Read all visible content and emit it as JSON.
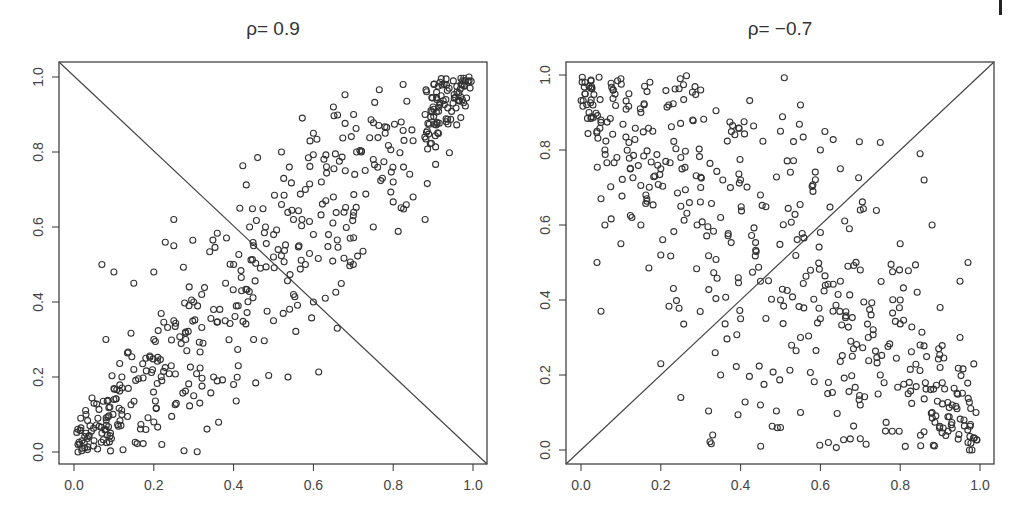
{
  "chart_data": [
    {
      "type": "scatter",
      "title": "ρ= 0.9",
      "xlabel": "",
      "ylabel": "",
      "xlim": [
        0,
        1
      ],
      "ylim": [
        0,
        1
      ],
      "x_ticks": [
        "0.0",
        "0.2",
        "0.4",
        "0.6",
        "0.8",
        "1.0"
      ],
      "y_ticks": [
        "0.0",
        "0.2",
        "0.4",
        "0.6",
        "0.8",
        "1.0"
      ],
      "grid": false,
      "legend": null,
      "reference_line": {
        "from": [
          0,
          1
        ],
        "to": [
          1,
          0
        ],
        "description": "anti-diagonal line from top-left to bottom-right corner"
      },
      "marker": "open circle",
      "correlation": 0.9,
      "n_points_approx": 500,
      "sample_points": [
        [
          0.01,
          0.0
        ],
        [
          0.02,
          0.03
        ],
        [
          0.01,
          0.02
        ],
        [
          0.03,
          0.05
        ],
        [
          0.02,
          0.01
        ],
        [
          0.04,
          0.07
        ],
        [
          0.05,
          0.03
        ],
        [
          0.06,
          0.09
        ],
        [
          0.03,
          0.1
        ],
        [
          0.07,
          0.05
        ],
        [
          0.08,
          0.06
        ],
        [
          0.09,
          0.12
        ],
        [
          0.1,
          0.14
        ],
        [
          0.05,
          0.13
        ],
        [
          0.12,
          0.1
        ],
        [
          0.08,
          0.3
        ],
        [
          0.07,
          0.5
        ],
        [
          0.1,
          0.48
        ],
        [
          0.12,
          0.2
        ],
        [
          0.15,
          0.22
        ],
        [
          0.18,
          0.25
        ],
        [
          0.2,
          0.3
        ],
        [
          0.22,
          0.19
        ],
        [
          0.25,
          0.35
        ],
        [
          0.28,
          0.3
        ],
        [
          0.2,
          0.48
        ],
        [
          0.25,
          0.55
        ],
        [
          0.3,
          0.4
        ],
        [
          0.32,
          0.42
        ],
        [
          0.35,
          0.38
        ],
        [
          0.38,
          0.45
        ],
        [
          0.4,
          0.5
        ],
        [
          0.42,
          0.43
        ],
        [
          0.45,
          0.55
        ],
        [
          0.48,
          0.6
        ],
        [
          0.5,
          0.52
        ],
        [
          0.44,
          0.6
        ],
        [
          0.52,
          0.66
        ],
        [
          0.55,
          0.62
        ],
        [
          0.58,
          0.7
        ],
        [
          0.6,
          0.58
        ],
        [
          0.62,
          0.72
        ],
        [
          0.65,
          0.68
        ],
        [
          0.68,
          0.75
        ],
        [
          0.7,
          0.63
        ],
        [
          0.72,
          0.8
        ],
        [
          0.75,
          0.78
        ],
        [
          0.78,
          0.85
        ],
        [
          0.8,
          0.72
        ],
        [
          0.82,
          0.88
        ],
        [
          0.85,
          0.83
        ],
        [
          0.88,
          0.9
        ],
        [
          0.9,
          0.92
        ],
        [
          0.92,
          0.95
        ],
        [
          0.94,
          0.97
        ],
        [
          0.96,
          0.96
        ],
        [
          0.98,
          0.99
        ],
        [
          0.95,
          0.93
        ],
        [
          0.97,
          0.98
        ],
        [
          0.99,
          1.0
        ],
        [
          0.3,
          0.15
        ],
        [
          0.35,
          0.2
        ],
        [
          0.4,
          0.18
        ],
        [
          0.45,
          0.3
        ],
        [
          0.5,
          0.35
        ],
        [
          0.55,
          0.42
        ],
        [
          0.6,
          0.4
        ],
        [
          0.66,
          0.33
        ],
        [
          0.7,
          0.5
        ],
        [
          0.25,
          0.62
        ],
        [
          0.15,
          0.45
        ],
        [
          0.52,
          0.8
        ],
        [
          0.6,
          0.85
        ],
        [
          0.65,
          0.92
        ],
        [
          0.88,
          0.62
        ],
        [
          0.85,
          0.68
        ],
        [
          0.75,
          0.6
        ],
        [
          0.58,
          0.5
        ],
        [
          0.2,
          0.08
        ],
        [
          0.22,
          0.02
        ]
      ]
    },
    {
      "type": "scatter",
      "title": "ρ= −0.7",
      "xlabel": "",
      "ylabel": "",
      "xlim": [
        0,
        1
      ],
      "ylim": [
        0,
        1
      ],
      "x_ticks": [
        "0.0",
        "0.2",
        "0.4",
        "0.6",
        "0.8",
        "1.0"
      ],
      "y_ticks": [
        "0.0",
        "0.2",
        "0.4",
        "0.6",
        "0.8",
        "1.0"
      ],
      "grid": false,
      "legend": null,
      "reference_line": {
        "from": [
          0,
          0
        ],
        "to": [
          1,
          1
        ],
        "description": "diagonal line from bottom-left to top-right corner"
      },
      "marker": "open circle",
      "correlation": -0.7,
      "n_points_approx": 500,
      "sample_points": [
        [
          0.01,
          0.98
        ],
        [
          0.02,
          0.97
        ],
        [
          0.01,
          0.95
        ],
        [
          0.03,
          0.92
        ],
        [
          0.02,
          0.9
        ],
        [
          0.05,
          0.88
        ],
        [
          0.08,
          0.96
        ],
        [
          0.1,
          0.99
        ],
        [
          0.12,
          0.95
        ],
        [
          0.15,
          0.9
        ],
        [
          0.04,
          0.85
        ],
        [
          0.06,
          0.8
        ],
        [
          0.09,
          0.78
        ],
        [
          0.12,
          0.82
        ],
        [
          0.18,
          0.85
        ],
        [
          0.2,
          0.75
        ],
        [
          0.22,
          0.92
        ],
        [
          0.25,
          0.78
        ],
        [
          0.28,
          0.88
        ],
        [
          0.3,
          0.96
        ],
        [
          0.05,
          0.67
        ],
        [
          0.06,
          0.6
        ],
        [
          0.04,
          0.5
        ],
        [
          0.05,
          0.37
        ],
        [
          0.1,
          0.55
        ],
        [
          0.15,
          0.6
        ],
        [
          0.2,
          0.52
        ],
        [
          0.25,
          0.65
        ],
        [
          0.3,
          0.7
        ],
        [
          0.35,
          0.62
        ],
        [
          0.4,
          0.72
        ],
        [
          0.45,
          0.68
        ],
        [
          0.5,
          0.85
        ],
        [
          0.55,
          0.92
        ],
        [
          0.6,
          0.8
        ],
        [
          0.65,
          0.75
        ],
        [
          0.7,
          0.64
        ],
        [
          0.75,
          0.82
        ],
        [
          0.85,
          0.79
        ],
        [
          0.86,
          0.72
        ],
        [
          0.2,
          0.23
        ],
        [
          0.25,
          0.14
        ],
        [
          0.33,
          0.04
        ],
        [
          0.35,
          0.2
        ],
        [
          0.4,
          0.35
        ],
        [
          0.45,
          0.45
        ],
        [
          0.5,
          0.4
        ],
        [
          0.55,
          0.3
        ],
        [
          0.6,
          0.35
        ],
        [
          0.62,
          0.18
        ],
        [
          0.65,
          0.45
        ],
        [
          0.68,
          0.25
        ],
        [
          0.7,
          0.12
        ],
        [
          0.72,
          0.3
        ],
        [
          0.75,
          0.2
        ],
        [
          0.78,
          0.05
        ],
        [
          0.8,
          0.4
        ],
        [
          0.82,
          0.15
        ],
        [
          0.85,
          0.28
        ],
        [
          0.88,
          0.1
        ],
        [
          0.9,
          0.22
        ],
        [
          0.92,
          0.05
        ],
        [
          0.93,
          0.12
        ],
        [
          0.95,
          0.3
        ],
        [
          0.96,
          0.08
        ],
        [
          0.97,
          0.02
        ],
        [
          0.98,
          0.0
        ],
        [
          0.99,
          0.1
        ],
        [
          0.9,
          0.38
        ],
        [
          0.95,
          0.45
        ],
        [
          0.97,
          0.5
        ],
        [
          0.88,
          0.6
        ],
        [
          0.8,
          0.55
        ],
        [
          0.7,
          0.48
        ],
        [
          0.6,
          0.58
        ],
        [
          0.45,
          0.12
        ],
        [
          0.5,
          0.06
        ],
        [
          0.55,
          0.1
        ],
        [
          0.62,
          0.02
        ],
        [
          0.7,
          0.03
        ]
      ]
    }
  ],
  "figure": {
    "panels": [
      {
        "title": "ρ= 0.9"
      },
      {
        "title": "ρ= −0.7"
      }
    ],
    "tick_labels": [
      "0.0",
      "0.2",
      "0.4",
      "0.6",
      "0.8",
      "1.0"
    ]
  }
}
